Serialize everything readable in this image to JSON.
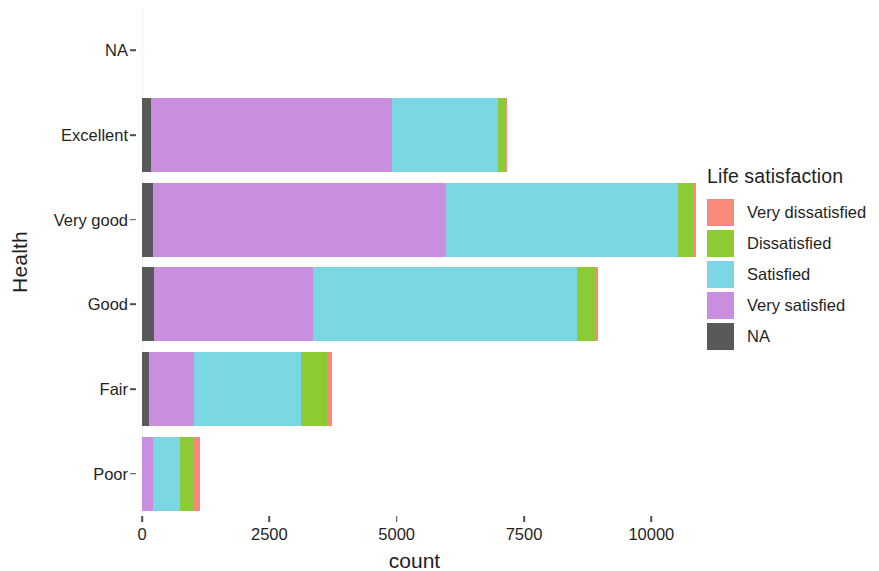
{
  "chart_data": {
    "type": "bar",
    "subtype": "stacked-horizontal",
    "title": "",
    "xlabel": "count",
    "ylabel": "Health",
    "xlim": [
      0,
      10700
    ],
    "xticks": [
      0,
      2500,
      5000,
      7500,
      10000
    ],
    "xtick_labels": [
      "0",
      "2500",
      "5000",
      "7500",
      "10000"
    ],
    "categories": [
      "NA",
      "Excellent",
      "Very good",
      "Good",
      "Fair",
      "Poor"
    ],
    "grid": false,
    "legend": {
      "title": "Life satisfaction",
      "position": "right",
      "entries": [
        {
          "label": "Very dissatisfied",
          "color": "#F98A7B"
        },
        {
          "label": "Dissatisfied",
          "color": "#8CCB33"
        },
        {
          "label": "Satisfied",
          "color": "#7BD7E3"
        },
        {
          "label": "Very satisfied",
          "color": "#C98FDE"
        },
        {
          "label": "NA",
          "color": "#595959"
        }
      ]
    },
    "stack_order": [
      "NA",
      "Very satisfied",
      "Satisfied",
      "Dissatisfied",
      "Very dissatisfied"
    ],
    "series": [
      {
        "name": "NA",
        "color": "#595959",
        "values": [
          0,
          170,
          210,
          230,
          130,
          0
        ]
      },
      {
        "name": "Very satisfied",
        "color": "#C98FDE",
        "values": [
          0,
          4730,
          5750,
          3130,
          890,
          210
        ]
      },
      {
        "name": "Satisfied",
        "color": "#7BD7E3",
        "values": [
          0,
          2090,
          4570,
          5190,
          2110,
          530
        ]
      },
      {
        "name": "Dissatisfied",
        "color": "#8CCB33",
        "values": [
          0,
          130,
          280,
          340,
          510,
          260
        ]
      },
      {
        "name": "Very dissatisfied",
        "color": "#F98A7B",
        "values": [
          0,
          40,
          60,
          60,
          90,
          130
        ]
      }
    ],
    "totals": [
      0,
      7160,
      10870,
      8950,
      3730,
      1130
    ]
  }
}
